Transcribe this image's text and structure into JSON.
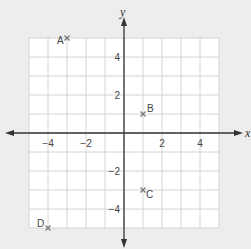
{
  "chart_data": {
    "type": "scatter",
    "title": "",
    "xlabel": "x",
    "ylabel": "y",
    "xlim": [
      -5,
      5
    ],
    "ylim": [
      -5,
      5
    ],
    "grid": true,
    "x_ticks": [
      -4,
      -2,
      2,
      4
    ],
    "y_ticks": [
      -4,
      -2,
      2,
      4
    ],
    "x_tick_labels": [
      "−4",
      "−2",
      "2",
      "4"
    ],
    "y_tick_labels": [
      "−4",
      "−2",
      "2",
      "4"
    ],
    "points": [
      {
        "label": "A",
        "x": -3,
        "y": 5
      },
      {
        "label": "B",
        "x": 1,
        "y": 1
      },
      {
        "label": "C",
        "x": 1,
        "y": -3
      },
      {
        "label": "D",
        "x": -4,
        "y": -5
      }
    ],
    "marker": "x",
    "colors": {
      "background": "#ededed",
      "grid_bg": "#ffffff",
      "grid_line": "#d4d4d4",
      "axis": "#333333",
      "marker": "#777777",
      "text": "#444444"
    }
  }
}
